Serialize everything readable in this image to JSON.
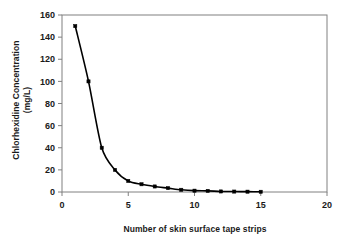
{
  "chart_data": {
    "type": "line",
    "title": "",
    "xlabel": "Number of skin surface tape strips",
    "ylabel_line1": "Chlorhexidine Concentration",
    "ylabel_line2": "(mg/L)",
    "x": [
      1,
      2,
      3,
      4,
      5,
      6,
      7,
      8,
      9,
      10,
      11,
      12,
      13,
      14,
      15
    ],
    "values": [
      150,
      100,
      40,
      20,
      10,
      7,
      5,
      3.5,
      2,
      1.2,
      1,
      0.5,
      0.4,
      0.3,
      0.2
    ],
    "series": [
      {
        "name": "Chlorhexidine Concentration",
        "values": [
          150,
          100,
          40,
          20,
          10,
          7,
          5,
          3.5,
          2,
          1.2,
          1,
          0.5,
          0.4,
          0.3,
          0.2
        ]
      }
    ],
    "xlim": [
      0,
      20
    ],
    "ylim": [
      0,
      160
    ],
    "xticks": [
      "0",
      "5",
      "10",
      "15",
      "20"
    ],
    "xtick_values": [
      0,
      5,
      10,
      15,
      20
    ],
    "yticks": [
      "0",
      "20",
      "40",
      "60",
      "80",
      "100",
      "120",
      "140",
      "160"
    ],
    "ytick_values": [
      0,
      20,
      40,
      60,
      80,
      100,
      120,
      140,
      160
    ],
    "grid": false,
    "legend": "none",
    "marker": "square",
    "marker_color": "#000000",
    "line_color": "#000000",
    "plot_background": "#ffffff",
    "axis_color": "#808080"
  }
}
